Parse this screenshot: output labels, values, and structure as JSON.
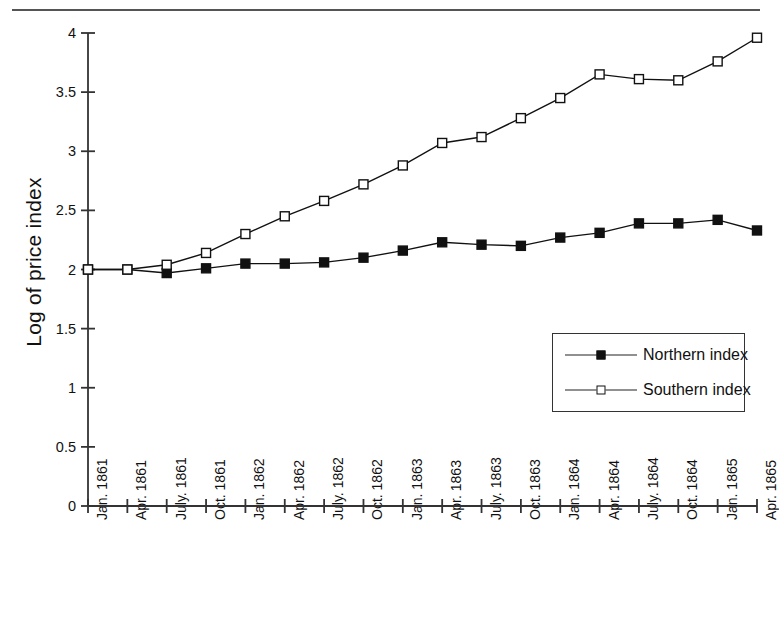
{
  "figure": {
    "top_rule": "horizontal-rule"
  },
  "chart_data": {
    "type": "line",
    "title": "",
    "xlabel": "",
    "ylabel": "Log of price index",
    "ylim": [
      0,
      4
    ],
    "ytick_labels": [
      "4",
      "3.5",
      "3",
      "2.5",
      "2",
      "1.5",
      "1",
      "0.5",
      "0"
    ],
    "ytick_values": [
      4,
      3.5,
      3,
      2.5,
      2,
      1.5,
      1,
      0.5,
      0
    ],
    "grid": false,
    "legend_position": "inside-lower-right",
    "categories": [
      "Jan. 1861",
      "Apr. 1861",
      "July. 1861",
      "Oct. 1861",
      "Jan. 1862",
      "Apr. 1862",
      "July. 1862",
      "Oct. 1862",
      "Jan. 1863",
      "Apr. 1863",
      "July. 1863",
      "Oct. 1863",
      "Jan. 1864",
      "Apr. 1864",
      "July. 1864",
      "Oct. 1864",
      "Jan. 1865",
      "Apr. 1865"
    ],
    "series": [
      {
        "name": "Northern index",
        "marker": "filled-square",
        "color": "#111111",
        "values": [
          2.0,
          2.0,
          1.97,
          2.01,
          2.05,
          2.05,
          2.06,
          2.1,
          2.16,
          2.23,
          2.21,
          2.2,
          2.27,
          2.31,
          2.39,
          2.39,
          2.42,
          2.33
        ]
      },
      {
        "name": "Southern index",
        "marker": "open-square",
        "color": "#111111",
        "values": [
          2.0,
          2.0,
          2.04,
          2.14,
          2.3,
          2.45,
          2.58,
          2.72,
          2.88,
          3.07,
          3.12,
          3.28,
          3.45,
          3.65,
          3.61,
          3.6,
          3.76,
          3.96
        ]
      }
    ]
  },
  "legend": {
    "items": [
      {
        "label": "Northern index",
        "marker": "filled-square"
      },
      {
        "label": "Southern index",
        "marker": "open-square"
      }
    ]
  }
}
